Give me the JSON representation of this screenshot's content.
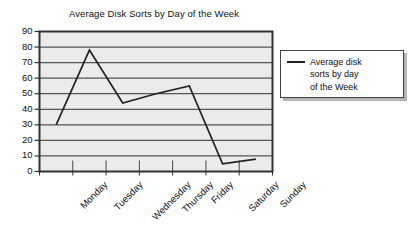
{
  "chart_data": {
    "type": "line",
    "title": "Average Disk Sorts by Day of the Week",
    "xlabel": "",
    "ylabel": "",
    "categories": [
      "Monday",
      "Tuesday",
      "Wednesday",
      "Thursday",
      "Friday",
      "Saturday",
      "Sunday"
    ],
    "values": [
      30,
      78,
      44,
      50,
      55,
      5,
      8
    ],
    "series": [
      {
        "name": "Average disk sorts by day of the Week",
        "values": [
          30,
          78,
          44,
          50,
          55,
          5,
          8
        ]
      }
    ],
    "ylim": [
      0,
      90
    ],
    "yticks": [
      0,
      10,
      20,
      30,
      40,
      50,
      60,
      70,
      80,
      90
    ],
    "ytick_labels": [
      "0",
      "10",
      "20",
      "30",
      "40",
      "50",
      "60",
      "70",
      "80",
      "90"
    ],
    "grid": "horizontal",
    "legend_position": "right",
    "legend_entries": [
      "Average disk\nsorts by day\nof the Week"
    ],
    "colors": {
      "line": "#222222",
      "plot_background": "#ebebeb",
      "gridline": "#555555",
      "axis": "#333333",
      "text": "#111111"
    }
  },
  "legend": {
    "label": "Average disk\nsorts by day\nof the Week"
  }
}
